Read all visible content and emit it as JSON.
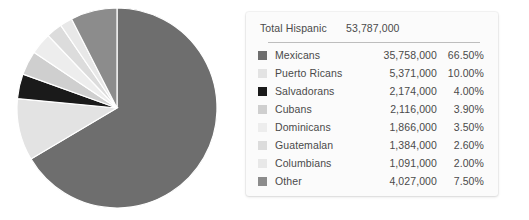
{
  "panel": {
    "total_label": "Total Hispanic",
    "total_value": "53,787,000"
  },
  "chart_data": {
    "type": "pie",
    "title": "",
    "legend_position": "right",
    "total": 53787000,
    "total_formatted": "53,787,000",
    "start_angle_deg": 0,
    "direction": "clockwise",
    "categories": [
      "Mexicans",
      "Puerto Ricans",
      "Salvadorans",
      "Cubans",
      "Dominicans",
      "Guatemalan",
      "Columbians",
      "Other"
    ],
    "values": [
      35758000,
      5371000,
      2174000,
      2116000,
      1866000,
      1384000,
      1091000,
      4027000
    ],
    "values_formatted": [
      "35,758,000",
      "5,371,000",
      "2,174,000",
      "2,116,000",
      "1,866,000",
      "1,384,000",
      "1,091,000",
      "4,027,000"
    ],
    "percentages": [
      66.5,
      10.0,
      4.0,
      3.9,
      3.5,
      2.6,
      2.0,
      7.5
    ],
    "percentages_formatted": [
      "66.50%",
      "10.00%",
      "4.00%",
      "3.90%",
      "2.60%",
      "2.00%",
      "3.50%",
      "7.50%"
    ],
    "colors": [
      "#6e6e6e",
      "#e3e3e3",
      "#1a1a1a",
      "#cfcfcf",
      "#ededed",
      "#dcdcdc",
      "#e8e8e8",
      "#8c8c8c"
    ]
  },
  "rows": [
    {
      "label": "Mexicans",
      "value": "35,758,000",
      "pct": "66.50%",
      "color": "#6e6e6e"
    },
    {
      "label": "Puerto Ricans",
      "value": "5,371,000",
      "pct": "10.00%",
      "color": "#e3e3e3"
    },
    {
      "label": "Salvadorans",
      "value": "2,174,000",
      "pct": "4.00%",
      "color": "#1a1a1a"
    },
    {
      "label": "Cubans",
      "value": "2,116,000",
      "pct": "3.90%",
      "color": "#cfcfcf"
    },
    {
      "label": "Dominicans",
      "value": "1,866,000",
      "pct": "3.50%",
      "color": "#ededed"
    },
    {
      "label": "Guatemalan",
      "value": "1,384,000",
      "pct": "2.60%",
      "color": "#dcdcdc"
    },
    {
      "label": "Columbians",
      "value": "1,091,000",
      "pct": "2.00%",
      "color": "#e8e8e8"
    },
    {
      "label": "Other",
      "value": "4,027,000",
      "pct": "7.50%",
      "color": "#8c8c8c"
    }
  ]
}
